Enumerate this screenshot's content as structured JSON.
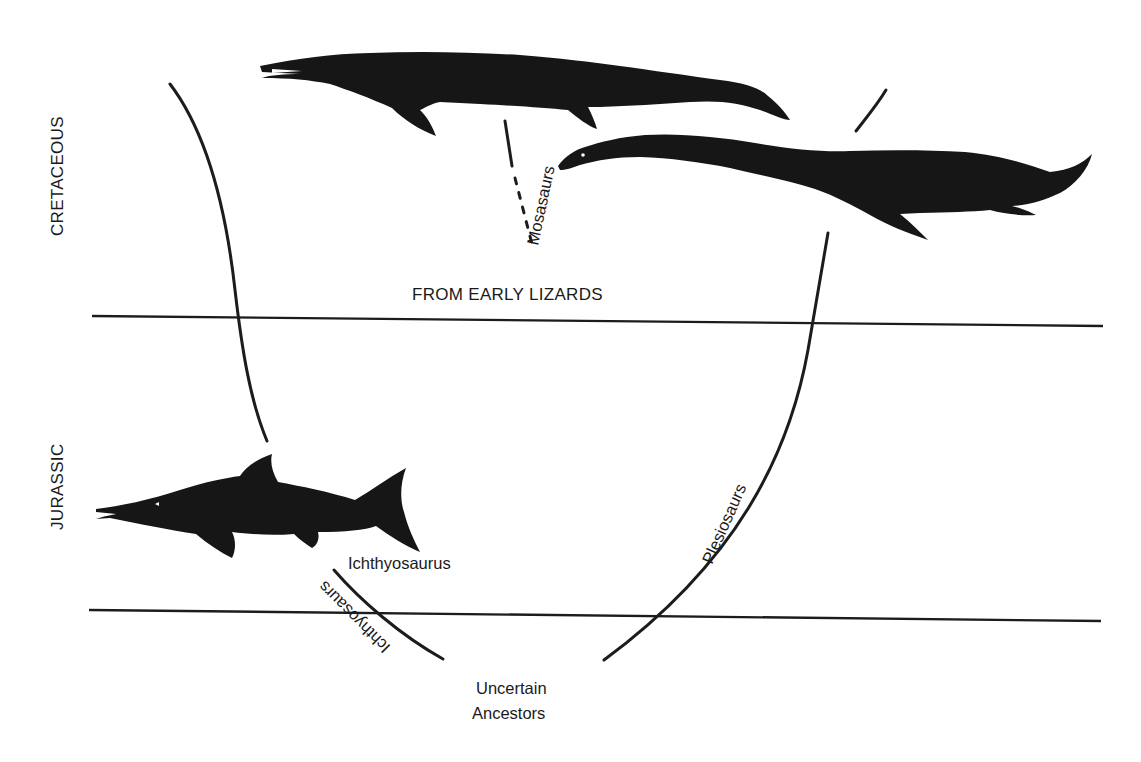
{
  "diagram": {
    "periods": [
      {
        "label": "CRETACEOUS"
      },
      {
        "label": "JURASSIC"
      }
    ],
    "boundary_caption": "FROM EARLY LIZARDS",
    "root_label": {
      "line1": "Uncertain",
      "line2": "Ancestors"
    },
    "lineages": {
      "mosasaurs": {
        "label": "Mosasaurs"
      },
      "plesiosaurs": {
        "label": "Plesiosaurs"
      },
      "ichthyosaurs": {
        "label": "Ichthyosaurs"
      }
    },
    "animals": {
      "ichthyosaurus": {
        "label": "Ichthyosaurus"
      },
      "mosasaur": {
        "name": "mosasaur-silhouette"
      },
      "plesiosaur": {
        "name": "plesiosaur-silhouette"
      }
    },
    "colors": {
      "ink": "#161616",
      "background": "#ffffff"
    }
  }
}
